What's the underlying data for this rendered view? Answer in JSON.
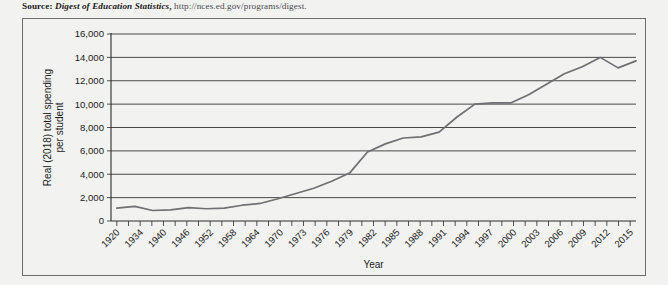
{
  "source": {
    "label": "Source:",
    "publication": "Digest of Education Statistics",
    "separator": ",",
    "url": "http://nces.ed.gov/programs/digest."
  },
  "chart_data": {
    "type": "line",
    "title": "",
    "xlabel": "Year",
    "ylabel": "Real (2018) total spending per student",
    "ylabel_lines": [
      "Real (2018) total spending",
      "per student"
    ],
    "ylim": [
      0,
      16000
    ],
    "yticks": [
      0,
      2000,
      4000,
      6000,
      8000,
      10000,
      12000,
      14000,
      16000
    ],
    "ytick_labels": [
      "0",
      "2,000",
      "4,000",
      "6,000",
      "8,000",
      "10,000",
      "12,000",
      "14,000",
      "16,000"
    ],
    "grid": true,
    "grid_axis": "y",
    "legend": "none",
    "line_color": "#6f6f74",
    "xtick_labels": [
      "1920",
      "1934",
      "1940",
      "1946",
      "1952",
      "1958",
      "1964",
      "1970",
      "1973",
      "1976",
      "1979",
      "1982",
      "1985",
      "1988",
      "1991",
      "1994",
      "1997",
      "2000",
      "2003",
      "2006",
      "2009",
      "2012",
      "2015"
    ],
    "x": [
      "1920",
      "1929",
      "1934",
      "1937",
      "1940",
      "1943",
      "1946",
      "1949",
      "1952",
      "1955",
      "1958",
      "1961",
      "1964",
      "1967",
      "1970",
      "1973",
      "1976",
      "1979",
      "1982",
      "1985",
      "1988",
      "1991",
      "1994",
      "1997",
      "2000",
      "2003",
      "2006",
      "2009",
      "2012",
      "2015"
    ],
    "values": [
      1100,
      1250,
      900,
      950,
      1150,
      1050,
      1100,
      1350,
      1500,
      1900,
      2350,
      2800,
      3400,
      4100,
      5900,
      6600,
      7100,
      7200,
      7600,
      8900,
      10000,
      10100,
      10100,
      10800,
      11700,
      12600,
      13200,
      14000,
      13100,
      13700
    ]
  }
}
